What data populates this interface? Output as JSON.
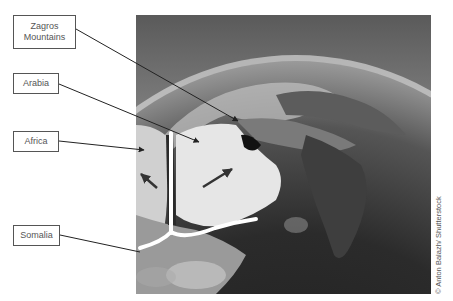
{
  "figure": {
    "labels": {
      "zagros": "Zagros Mountains",
      "arabia": "Arabia",
      "africa": "Africa",
      "somalia": "Somalia"
    },
    "credit": "© Anton Balazh/ Shutterstock",
    "image_description": "Satellite view of Earth showing Arabian Peninsula, Horn of Africa and India with rift lines and plate motion arrows",
    "colors": {
      "label_border": "#555555",
      "label_text": "#555555",
      "leader_line": "#222222",
      "rift_line": "#ffffff",
      "arrow": "#333333"
    }
  }
}
